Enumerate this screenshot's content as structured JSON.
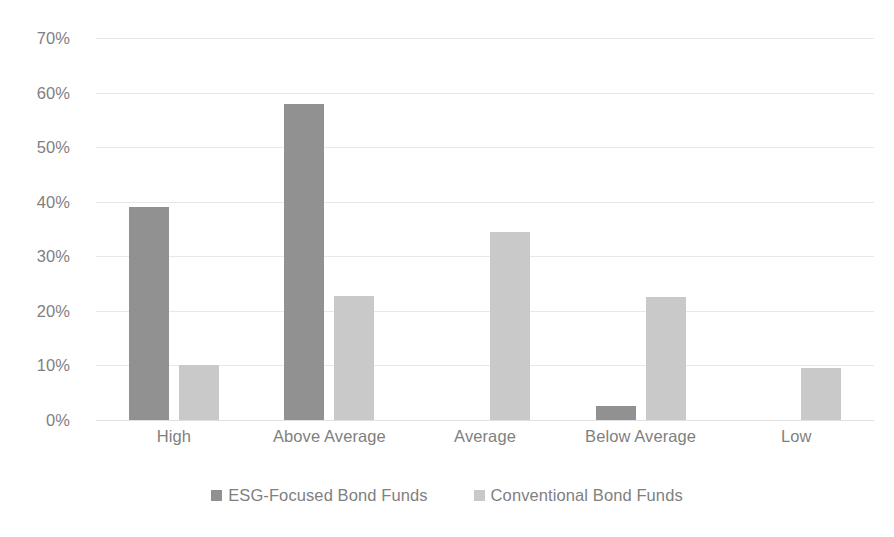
{
  "chart_data": {
    "type": "bar",
    "title": "",
    "subtitle": "",
    "xlabel": "",
    "ylabel": "",
    "categories": [
      "High",
      "Above Average",
      "Average",
      "Below Average",
      "Low"
    ],
    "series": [
      {
        "name": "ESG-Focused Bond Funds",
        "color": "#919191",
        "values": [
          39.0,
          58.0,
          0.0,
          2.5,
          0.0
        ]
      },
      {
        "name": "Conventional Bond Funds",
        "color": "#c9c9c9",
        "values": [
          10.0,
          22.8,
          34.5,
          22.5,
          9.5
        ]
      }
    ],
    "ylim": [
      0,
      70
    ],
    "y_ticks": [
      0,
      10,
      20,
      30,
      40,
      50,
      60,
      70
    ],
    "y_tick_labels": [
      "0%",
      "10%",
      "20%",
      "30%",
      "40%",
      "50%",
      "60%",
      "70%"
    ],
    "value_format": "percent",
    "grid": true,
    "grid_axis": "y",
    "legend_position": "bottom",
    "background_color": "#ffffff",
    "gridline_color": "#e8e8e8",
    "text_color": "#7f7f7f"
  }
}
